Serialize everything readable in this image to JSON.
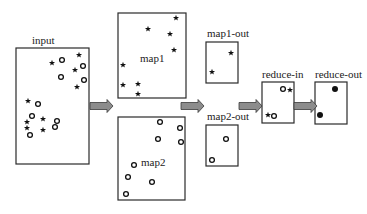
{
  "diagram": {
    "title": "",
    "nodes": [
      {
        "id": "input",
        "label": "input"
      },
      {
        "id": "map1",
        "label": "map1"
      },
      {
        "id": "map2",
        "label": "map2"
      },
      {
        "id": "map1-out",
        "label": "map1-out"
      },
      {
        "id": "map2-out",
        "label": "map2-out"
      },
      {
        "id": "reduce-in",
        "label": "reduce-in"
      },
      {
        "id": "reduce-out",
        "label": "reduce-out"
      }
    ],
    "edges": [
      {
        "from": "input",
        "to": "map1/map2"
      },
      {
        "from": "map1/map2",
        "to": "map1-out/map2-out"
      },
      {
        "from": "map1-out/map2-out",
        "to": "reduce-in"
      },
      {
        "from": "reduce-in",
        "to": "reduce-out"
      }
    ],
    "contents": {
      "input": {
        "stars": 9,
        "circles": 9
      },
      "map1": {
        "stars": 8,
        "circles": 0
      },
      "map2": {
        "stars": 0,
        "circles": 8
      },
      "map1-out": {
        "stars": 2,
        "circles": 0
      },
      "map2-out": {
        "stars": 0,
        "circles": 2
      },
      "reduce-in": {
        "stars": 2,
        "circles": 2
      },
      "reduce-out": {
        "dots": 2
      }
    },
    "symbol_legend": {
      "star": "star-marker",
      "circle": "circle-marker",
      "dot": "filled-dot-marker"
    }
  }
}
